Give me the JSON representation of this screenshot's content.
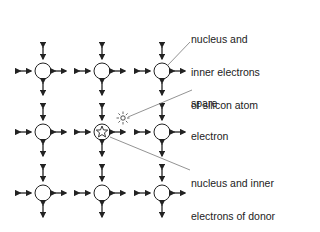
{
  "diagram": {
    "labels": {
      "silicon": [
        "nucleus and",
        "inner electrons",
        "of silicon atom"
      ],
      "spare": [
        "spare",
        "electron"
      ],
      "donor": [
        "nucleus and inner",
        "electrons of donor",
        "impurity atom"
      ]
    },
    "grid": {
      "cols": [
        43,
        102,
        162
      ],
      "rows": [
        71,
        132,
        193
      ],
      "radius": 8
    },
    "donor_position": {
      "col": 1,
      "row": 1
    },
    "spare_electron_position": {
      "x": 123,
      "y": 118
    },
    "colors": {
      "stroke": "#222222",
      "leader": "#777777"
    }
  }
}
